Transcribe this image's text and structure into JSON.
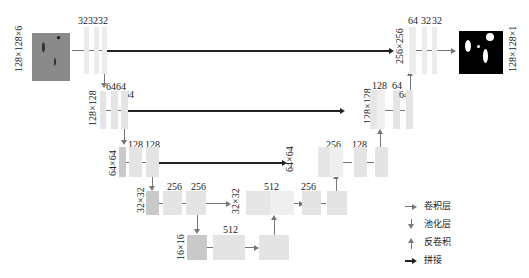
{
  "diagram": {
    "type": "U-Net architecture",
    "input": {
      "size_label": "128×128×6"
    },
    "output": {
      "size_label": "128×128×1"
    },
    "encoder": [
      {
        "level": 1,
        "size_label": "",
        "channels": [
          "32",
          "32",
          "32"
        ]
      },
      {
        "level": 2,
        "size_label": "128×128",
        "channels": [
          "64",
          "64",
          "64"
        ]
      },
      {
        "level": 3,
        "size_label": "64×64",
        "channels": [
          "128",
          "128"
        ]
      },
      {
        "level": 4,
        "size_label": "32×32",
        "channels": [
          "256",
          "256"
        ]
      },
      {
        "level": 5,
        "size_label": "16×16",
        "channels": [
          "512"
        ]
      }
    ],
    "decoder": [
      {
        "level": 4,
        "size_label": "32×32",
        "channels": [
          "512",
          "256"
        ]
      },
      {
        "level": 3,
        "size_label": "64×64",
        "channels": [
          "256",
          "128"
        ]
      },
      {
        "level": 2,
        "size_label": "128×128",
        "channels": [
          "128",
          "64",
          "64"
        ]
      },
      {
        "level": 1,
        "size_label": "256×256",
        "channels": [
          "64",
          "32",
          "32"
        ]
      }
    ],
    "top_channels_label": "323232"
  },
  "legend": [
    {
      "icon": "gray-right-arrow",
      "label": "卷积层"
    },
    {
      "icon": "gray-down-arrow",
      "label": "池化层"
    },
    {
      "icon": "gray-up-arrow",
      "label": "反卷积"
    },
    {
      "icon": "black-right-arrow",
      "label": "拼接"
    }
  ]
}
